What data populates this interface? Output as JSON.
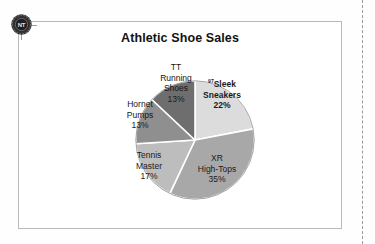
{
  "page": {
    "background_color": "#ffffff",
    "frame_border_color": "#b9b9b9",
    "margin_guide_color": "#9a9a9a"
  },
  "badge": {
    "icon": "seal-badge-icon",
    "label": "NT",
    "color": "#2b2b2b"
  },
  "chart_data": {
    "type": "pie",
    "title": "Athletic Shoe Sales",
    "xlabel": "",
    "ylabel": "",
    "legend_position": "none",
    "labels_inside_slices": true,
    "start_angle_deg": 0,
    "direction": "clockwise",
    "categories": [
      "Sleek Sneakers",
      "XR High-Tops",
      "Tennis Master",
      "Hornet Pumps",
      "TT Running Shoes"
    ],
    "values": [
      22,
      35,
      17,
      13,
      13
    ],
    "value_labels": [
      "22%",
      "35%",
      "17%",
      "13%",
      "13%"
    ],
    "colors": [
      "#dcdcdc",
      "#a8a8a8",
      "#bdbdbd",
      "#8f8f8f",
      "#6e6e6e"
    ],
    "separator_color": "#ffffff",
    "total": 100,
    "units": "%",
    "annotations": [
      {
        "target": "Sleek Sneakers",
        "marker": "97",
        "style": "superscript"
      }
    ],
    "slices": [
      {
        "name": "Sleek Sneakers",
        "name_line1": "Sleek",
        "name_line2": "Sneakers",
        "superscript": "97",
        "value": 22,
        "value_label": "22%",
        "color": "#dcdcdc",
        "bold": true
      },
      {
        "name": "XR High-Tops",
        "name_line1": "XR",
        "name_line2": "High-Tops",
        "superscript": "",
        "value": 35,
        "value_label": "35%",
        "color": "#a8a8a8",
        "bold": false
      },
      {
        "name": "Tennis Master",
        "name_line1": "Tennis",
        "name_line2": "Master",
        "superscript": "",
        "value": 17,
        "value_label": "17%",
        "color": "#bdbdbd",
        "bold": false
      },
      {
        "name": "Hornet Pumps",
        "name_line1": "Hornet",
        "name_line2": "Pumps",
        "superscript": "",
        "value": 13,
        "value_label": "13%",
        "color": "#8f8f8f",
        "bold": false
      },
      {
        "name": "TT Running Shoes",
        "name_line1": "TT",
        "name_line2": "Running",
        "name_line3": "Shoes",
        "superscript": "",
        "value": 13,
        "value_label": "13%",
        "color": "#6e6e6e",
        "bold": false
      }
    ]
  }
}
